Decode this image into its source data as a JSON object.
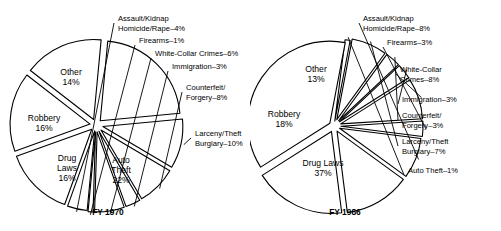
{
  "figure": {
    "type": "pie-pair",
    "background": "#ffffff",
    "line_color": "#000000",
    "fill_color": "#ffffff"
  },
  "chart_data": [
    {
      "type": "pie",
      "title": "FY 1970",
      "caption": "FY 1970",
      "center": [
        96,
        125
      ],
      "radius": 80,
      "units": "percent",
      "total": 100,
      "labels": [
        "Auto Theft",
        "Larceny/Theft Burglary",
        "Counterfeit/ Forgery",
        "Immigration",
        "White-Collar Crimes",
        "Firearms",
        "Assault/Kidnap Homicide/Rape",
        "Other",
        "Robbery",
        "Drug Laws"
      ],
      "values": [
        22,
        10,
        8,
        3,
        6,
        1,
        4,
        14,
        16,
        16
      ],
      "slices": [
        {
          "name": "auto-theft",
          "label_lines": [
            "Auto",
            "Theft",
            "22%"
          ],
          "value": 22,
          "pct": "22%",
          "placement": "inside",
          "cx": 121,
          "cy": 163
        },
        {
          "name": "larceny-theft-burglary",
          "label_lines": [
            "Larceny/Theft",
            "Burglary–10%"
          ],
          "value": 10,
          "pct": "10%",
          "placement": "outside",
          "lx": 195,
          "ly": 136
        },
        {
          "name": "counterfeit-forgery",
          "label_lines": [
            "Counterfeit/",
            "Forgery–8%"
          ],
          "value": 8,
          "pct": "8%",
          "placement": "outside",
          "lx": 186,
          "ly": 90
        },
        {
          "name": "immigration",
          "label_lines": [
            "Immigration–3%"
          ],
          "value": 3,
          "pct": "3%",
          "placement": "outside",
          "lx": 172,
          "ly": 69
        },
        {
          "name": "white-collar-crimes",
          "label_lines": [
            "White-Collar Crimes–6%"
          ],
          "value": 6,
          "pct": "6%",
          "placement": "outside",
          "lx": 155,
          "ly": 56
        },
        {
          "name": "firearms",
          "label_lines": [
            "Firearms–1%"
          ],
          "value": 1,
          "pct": "1%",
          "placement": "outside",
          "lx": 139,
          "ly": 43
        },
        {
          "name": "assault-kidnap-homicide-rape",
          "label_lines": [
            "Assault/Kidnap",
            "Homicide/Rape–4%"
          ],
          "value": 4,
          "pct": "4%",
          "placement": "outside",
          "lx": 118,
          "ly": 21
        },
        {
          "name": "other",
          "label_lines": [
            "Other",
            "14%"
          ],
          "value": 14,
          "pct": "14%",
          "placement": "inside",
          "cx": 71,
          "cy": 75
        },
        {
          "name": "robbery",
          "label_lines": [
            "Robbery",
            "16%"
          ],
          "value": 16,
          "pct": "16%",
          "placement": "inside",
          "cx": 44,
          "cy": 121
        },
        {
          "name": "drug-laws",
          "label_lines": [
            "Drug",
            "Laws",
            "16%"
          ],
          "value": 16,
          "pct": "16%",
          "placement": "inside",
          "cx": 67,
          "cy": 161
        }
      ]
    },
    {
      "type": "pie",
      "title": "FY 1986",
      "caption": "FY 1986",
      "center": [
        84,
        126
      ],
      "radius": 82,
      "units": "percent",
      "total": 100,
      "labels": [
        "Auto Theft",
        "Larceny/Theft Burglary",
        "Counterfeit/ Forgery",
        "Immigration",
        "White-Collar Crimes",
        "Firearms",
        "Assault/Kidnap Homicide/Rape",
        "Other",
        "Robbery",
        "Drug Laws"
      ],
      "values": [
        1,
        7,
        3,
        3,
        8,
        3,
        8,
        13,
        18,
        37
      ],
      "slices": [
        {
          "name": "auto-theft",
          "label_lines": [
            "Auto Theft–1%"
          ],
          "value": 1,
          "pct": "1%",
          "placement": "outside",
          "lx": 158,
          "ly": 173
        },
        {
          "name": "larceny-theft-burglary",
          "label_lines": [
            "Larceny/Theft",
            "Burglary–7%"
          ],
          "value": 7,
          "pct": "7%",
          "placement": "outside",
          "lx": 152,
          "ly": 144
        },
        {
          "name": "counterfeit-forgery",
          "label_lines": [
            "Counterfeit/",
            "Forgery–3%"
          ],
          "value": 3,
          "pct": "3%",
          "placement": "outside",
          "lx": 152,
          "ly": 118
        },
        {
          "name": "immigration",
          "label_lines": [
            "Immigration–3%"
          ],
          "value": 3,
          "pct": "3%",
          "placement": "outside",
          "lx": 152,
          "ly": 102
        },
        {
          "name": "white-collar-crimes",
          "label_lines": [
            "White-Collar",
            "Crimes–8%"
          ],
          "value": 8,
          "pct": "8%",
          "placement": "outside",
          "lx": 150,
          "ly": 72
        },
        {
          "name": "firearms",
          "label_lines": [
            "Firearms–3%"
          ],
          "value": 3,
          "pct": "3%",
          "placement": "outside",
          "lx": 137,
          "ly": 45
        },
        {
          "name": "assault-kidnap-homicide-rape",
          "label_lines": [
            "Assault/Kidnap",
            "Homicide/Rape–8%"
          ],
          "value": 8,
          "pct": "8%",
          "placement": "outside",
          "lx": 113,
          "ly": 21
        },
        {
          "name": "other",
          "label_lines": [
            "Other",
            "13%"
          ],
          "value": 13,
          "pct": "13%",
          "placement": "inside",
          "cx": 66,
          "cy": 72
        },
        {
          "name": "robbery",
          "label_lines": [
            "Robbery",
            "18%"
          ],
          "value": 18,
          "pct": "18%",
          "placement": "inside",
          "cx": 34,
          "cy": 117
        },
        {
          "name": "drug-laws",
          "label_lines": [
            "Drug Laws",
            "37%"
          ],
          "value": 37,
          "pct": "37%",
          "placement": "inside",
          "cx": 73,
          "cy": 166
        }
      ]
    }
  ]
}
